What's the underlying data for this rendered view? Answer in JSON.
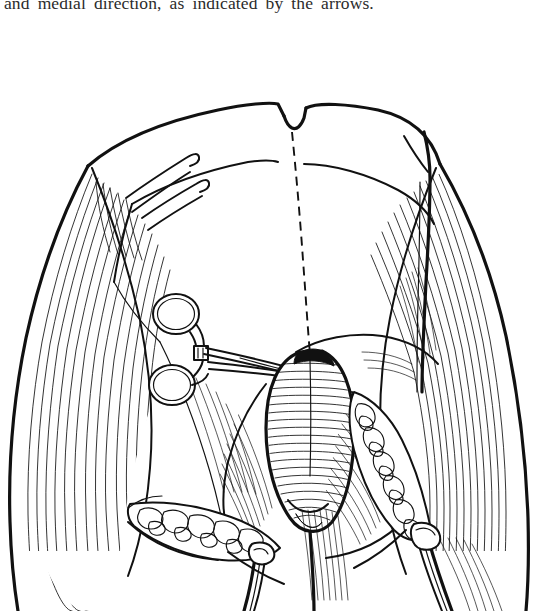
{
  "page": {
    "background_color": "#ffffff",
    "ink_color": "#111111",
    "width": 542,
    "height": 611
  },
  "caption": {
    "text": "and medial direction, as indicated by the arrows.",
    "clipped": "true"
  },
  "figure": {
    "style": "black-and-white pen-and-ink line art with hatching",
    "parts": {
      "midline_incision": "dashed vertical midline incision line",
      "clamp": "hemostat forceps with two finger rings grasping tissue at apex",
      "central_structure": "oval hatched structure at center of dissection",
      "left_fat_chain": "lobulated fatty / nodular tissue chain on left",
      "right_fat_chain": "lobulated fatty / nodular tissue chain on right",
      "left_cord": "cord and vessel bundle descending at lower left",
      "right_cord": "cord and vessel bundle descending at lower right",
      "left_thigh": "hatched thigh contour at left",
      "right_thigh": "hatched thigh contour at right",
      "retractor": "forked retractor at upper right",
      "skin_hooks": "paired skin hooks at upper left",
      "apex_notch": "notch at upper apex of skin flap"
    }
  }
}
